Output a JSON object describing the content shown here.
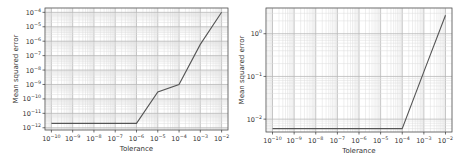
{
  "chart_data": [
    {
      "type": "line",
      "title": "",
      "xlabel": "Tolerance",
      "ylabel": "Mean squared error",
      "xscale": "log",
      "yscale": "log",
      "xlim": [
        5e-11,
        0.02
      ],
      "ylim": [
        7e-13,
        0.0002
      ],
      "grid": {
        "major": true,
        "minor": true
      },
      "legend": null,
      "x_ticks": [
        -10,
        -9,
        -8,
        -7,
        -6,
        -5,
        -4,
        -3,
        -2
      ],
      "x_tick_labels": [
        "10^-10",
        "10^-9",
        "10^-8",
        "10^-7",
        "10^-6",
        "10^-5",
        "10^-4",
        "10^-3",
        "10^-2"
      ],
      "y_ticks": [
        -12,
        -11,
        -10,
        -9,
        -8,
        -7,
        -6,
        -5,
        -4
      ],
      "y_tick_labels": [
        "10^-12",
        "10^-11",
        "10^-10",
        "10^-9",
        "10^-8",
        "10^-7",
        "10^-6",
        "10^-5",
        "10^-4"
      ],
      "series": [
        {
          "name": "MSE",
          "color": "#555555",
          "x": [
            1e-10,
            1e-09,
            1e-08,
            1e-07,
            1e-06,
            1e-05,
            0.0001,
            0.001,
            0.01
          ],
          "values": [
            2e-12,
            2e-12,
            2e-12,
            2e-12,
            2e-12,
            3e-10,
            1e-09,
            6e-07,
            0.0001
          ]
        }
      ]
    },
    {
      "type": "line",
      "title": "",
      "xlabel": "Tolerance",
      "ylabel": "Mean squared error",
      "xscale": "log",
      "yscale": "log",
      "xlim": [
        5e-11,
        0.02
      ],
      "ylim": [
        0.005,
        4
      ],
      "grid": {
        "major": true,
        "minor": true
      },
      "legend": null,
      "x_ticks": [
        -10,
        -9,
        -8,
        -7,
        -6,
        -5,
        -4,
        -3,
        -2
      ],
      "x_tick_labels": [
        "10^-10",
        "10^-9",
        "10^-8",
        "10^-7",
        "10^-6",
        "10^-5",
        "10^-4",
        "10^-3",
        "10^-2"
      ],
      "y_ticks": [
        -2,
        -1,
        0
      ],
      "y_tick_labels": [
        "10^-2",
        "10^-1",
        "10^0"
      ],
      "series": [
        {
          "name": "MSE",
          "color": "#555555",
          "x": [
            1e-10,
            1e-09,
            1e-08,
            1e-07,
            1e-06,
            1e-05,
            0.0001,
            0.001,
            0.01
          ],
          "values": [
            0.006,
            0.006,
            0.006,
            0.006,
            0.006,
            0.006,
            0.006,
            0.13,
            2.7
          ]
        }
      ]
    }
  ],
  "layout": [
    {
      "left": 0,
      "width": 235,
      "frame": {
        "x0": 45,
        "y0": 8,
        "x1": 228,
        "y1": 130
      }
    },
    {
      "left": 235,
      "width": 236,
      "frame": {
        "x0": 31,
        "y0": 8,
        "x1": 217,
        "y1": 132
      }
    }
  ]
}
